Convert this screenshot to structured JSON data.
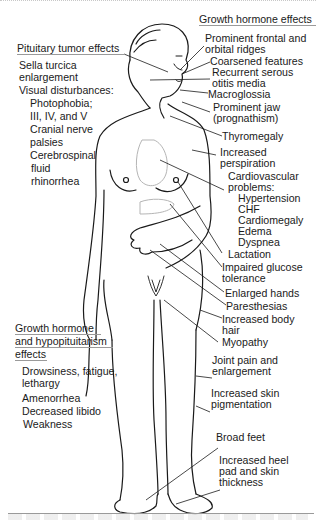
{
  "groups": {
    "pituitary_tumor": {
      "header": "Pituitary tumor effects",
      "items": [
        "Sella turcica",
        "enlargement",
        "Visual disturbances:",
        "Photophobia;",
        "III, IV, and V",
        "Cranial nerve",
        "palsies",
        "Cerebrospinal",
        "fluid",
        "rhinorrhea"
      ]
    },
    "growth_hormone": {
      "header": "Growth hormone effects",
      "items": [
        "Prominent frontal and",
        "orbital ridges",
        "Coarsened features",
        "Recurrent serous",
        "otitis media",
        "Macroglossia",
        "Prominent jaw",
        "(prognathism)",
        "Thyromegaly",
        "Increased",
        "perspiration",
        "Cardiovascular",
        "problems:",
        "Hypertension",
        "CHF",
        "Cardiomegaly",
        "Edema",
        "Dyspnea",
        "Lactation",
        "Impaired glucose",
        "tolerance",
        "Enlarged hands",
        "Paresthesias",
        "Increased body",
        "hair",
        "Myopathy",
        "Joint pain and",
        "enlargement",
        "Increased skin",
        "pigmentation",
        "Broad feet",
        "Increased heel",
        "pad and skin",
        "thickness"
      ]
    },
    "hypopituitarism": {
      "header_lines": [
        "Growth hormone",
        "and hypopituitarism",
        "effects"
      ],
      "items": [
        "Drowsiness, fatigue,",
        "lethargy",
        "Amenorrhea",
        "Decreased libido",
        "Weakness"
      ]
    }
  },
  "colors": {
    "line": "#1a1a1a",
    "rule": "#9a9a9a",
    "organ": "#b5b5b5"
  }
}
